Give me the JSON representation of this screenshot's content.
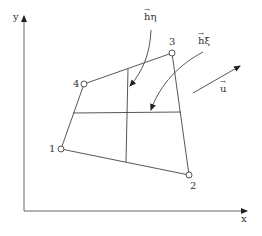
{
  "diagram": {
    "axes": {
      "x_label": "x",
      "y_label": "y"
    },
    "nodes": [
      {
        "id": "1",
        "label": "1"
      },
      {
        "id": "2",
        "label": "2"
      },
      {
        "id": "3",
        "label": "3"
      },
      {
        "id": "4",
        "label": "4"
      }
    ],
    "vectors": {
      "h_eta": {
        "symbol": "h",
        "subscript": "η",
        "arrow": "→"
      },
      "h_xi": {
        "symbol": "h",
        "subscript": "ξ",
        "arrow": "→"
      },
      "u": {
        "symbol": "u",
        "arrow": "→"
      }
    },
    "colors": {
      "line": "#444444",
      "text": "#333333",
      "background": "#ffffff"
    }
  }
}
